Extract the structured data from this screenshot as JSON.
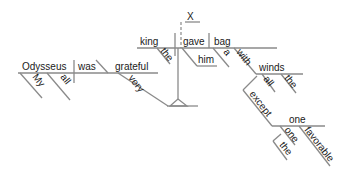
{
  "diagram": {
    "type": "reed-kellogg-sentence-diagram",
    "colors": {
      "line": "#8a8a8a",
      "text": "#1a1a1a",
      "background": "#ffffff"
    },
    "words": {
      "x": "X",
      "king": "king",
      "the_king": "the",
      "gave": "gave",
      "him": "him",
      "bag": "bag",
      "a": "a",
      "with": "with",
      "winds": "winds",
      "all_winds": "all",
      "the_winds": "the",
      "except": "except",
      "one_obj": "one",
      "one_mod": "one",
      "the_one": "the",
      "favorable": "favorable",
      "odysseus": "Odysseus",
      "was": "was",
      "grateful": "grateful",
      "my": "My",
      "all_ody": "all",
      "very": "very"
    }
  }
}
